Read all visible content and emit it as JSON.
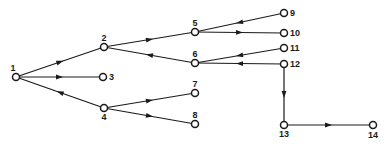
{
  "diagram": {
    "type": "directed-tree-graph",
    "colors": {
      "stroke": "#1a1a1a",
      "node_fill": "#ffffff",
      "background": "#ffffff"
    },
    "nodes": [
      {
        "id": "1",
        "label": "1",
        "x": 16,
        "y": 77,
        "label_dx": -3,
        "label_dy": -6,
        "anchor": "middle"
      },
      {
        "id": "2",
        "label": "2",
        "x": 104,
        "y": 47,
        "label_dx": 0,
        "label_dy": -6,
        "anchor": "middle"
      },
      {
        "id": "3",
        "label": "3",
        "x": 103,
        "y": 77,
        "label_dx": 6,
        "label_dy": 3,
        "anchor": "start"
      },
      {
        "id": "4",
        "label": "4",
        "x": 104,
        "y": 108,
        "label_dx": 0,
        "label_dy": 12,
        "anchor": "middle"
      },
      {
        "id": "5",
        "label": "5",
        "x": 195,
        "y": 32,
        "label_dx": 0,
        "label_dy": -6,
        "anchor": "middle"
      },
      {
        "id": "6",
        "label": "6",
        "x": 195,
        "y": 63,
        "label_dx": 0,
        "label_dy": -6,
        "anchor": "middle"
      },
      {
        "id": "7",
        "label": "7",
        "x": 195,
        "y": 93,
        "label_dx": 0,
        "label_dy": -6,
        "anchor": "middle"
      },
      {
        "id": "8",
        "label": "8",
        "x": 195,
        "y": 124,
        "label_dx": 0,
        "label_dy": -6,
        "anchor": "middle"
      },
      {
        "id": "9",
        "label": "9",
        "x": 284,
        "y": 13,
        "label_dx": 6,
        "label_dy": 3,
        "anchor": "start"
      },
      {
        "id": "10",
        "label": "10",
        "x": 284,
        "y": 33,
        "label_dx": 6,
        "label_dy": 3,
        "anchor": "start"
      },
      {
        "id": "11",
        "label": "11",
        "x": 284,
        "y": 48,
        "label_dx": 6,
        "label_dy": 3,
        "anchor": "start"
      },
      {
        "id": "12",
        "label": "12",
        "x": 284,
        "y": 64,
        "label_dx": 6,
        "label_dy": 3,
        "anchor": "start"
      },
      {
        "id": "13",
        "label": "13",
        "x": 284,
        "y": 125,
        "label_dx": 0,
        "label_dy": 12,
        "anchor": "middle"
      },
      {
        "id": "14",
        "label": "14",
        "x": 373,
        "y": 125,
        "label_dx": 0,
        "label_dy": 13,
        "anchor": "middle"
      }
    ],
    "edges": [
      {
        "from": "1",
        "to": "2"
      },
      {
        "from": "1",
        "to": "3"
      },
      {
        "from": "4",
        "to": "1"
      },
      {
        "from": "2",
        "to": "5"
      },
      {
        "from": "6",
        "to": "2"
      },
      {
        "from": "4",
        "to": "7"
      },
      {
        "from": "4",
        "to": "8"
      },
      {
        "from": "9",
        "to": "5"
      },
      {
        "from": "5",
        "to": "10"
      },
      {
        "from": "11",
        "to": "6"
      },
      {
        "from": "12",
        "to": "6"
      },
      {
        "from": "12",
        "to": "13"
      },
      {
        "from": "13",
        "to": "14"
      }
    ]
  }
}
